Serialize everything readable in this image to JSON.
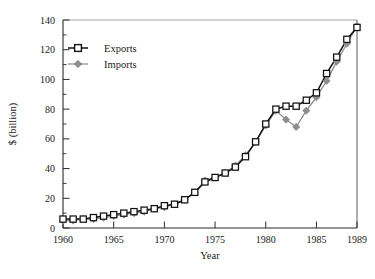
{
  "chart_data": {
    "type": "line",
    "title": "",
    "xlabel": "Year",
    "ylabel": "$ (billion)",
    "xlim": [
      1960,
      1989
    ],
    "ylim": [
      0,
      140
    ],
    "ytick_values": [
      0,
      20,
      40,
      60,
      80,
      100,
      120,
      140
    ],
    "ytick_labels": [
      "0",
      "20",
      "40",
      "60",
      "80",
      "100",
      "120",
      "140"
    ],
    "y_minor_step": 10,
    "xtick_values": [
      1960,
      1965,
      1970,
      1975,
      1980,
      1985,
      1989
    ],
    "xtick_labels": [
      "1960",
      "1965",
      "1970",
      "1975",
      "1980",
      "1985",
      "1989"
    ],
    "grid": false,
    "legend_position": "upper left inside",
    "x": [
      1960,
      1961,
      1962,
      1963,
      1964,
      1965,
      1966,
      1967,
      1968,
      1969,
      1970,
      1971,
      1972,
      1973,
      1974,
      1975,
      1976,
      1977,
      1978,
      1979,
      1980,
      1981,
      1982,
      1983,
      1984,
      1985,
      1986,
      1987,
      1988,
      1989
    ],
    "series": [
      {
        "name": "Exports",
        "color": "#111111",
        "marker": "open-square",
        "values": [
          6,
          6,
          6,
          7,
          8,
          9,
          10,
          11,
          12,
          13,
          15,
          16,
          19,
          24,
          31,
          34,
          37,
          41,
          48,
          58,
          70,
          80,
          82,
          82,
          86,
          91,
          104,
          115,
          127,
          135
        ]
      },
      {
        "name": "Imports",
        "color": "#8e8e8e",
        "marker": "filled-diamond",
        "values": [
          5,
          5,
          6,
          6,
          7,
          8,
          9,
          10,
          11,
          13,
          14,
          16,
          19,
          24,
          32,
          34,
          37,
          42,
          49,
          58,
          69,
          79,
          73,
          68,
          79,
          88,
          99,
          112,
          124,
          136
        ]
      }
    ]
  },
  "legend": {
    "items": [
      {
        "label": "Exports"
      },
      {
        "label": "Imports"
      }
    ]
  },
  "axes": {
    "x_title": "Year",
    "y_title": "$ (billion)"
  }
}
